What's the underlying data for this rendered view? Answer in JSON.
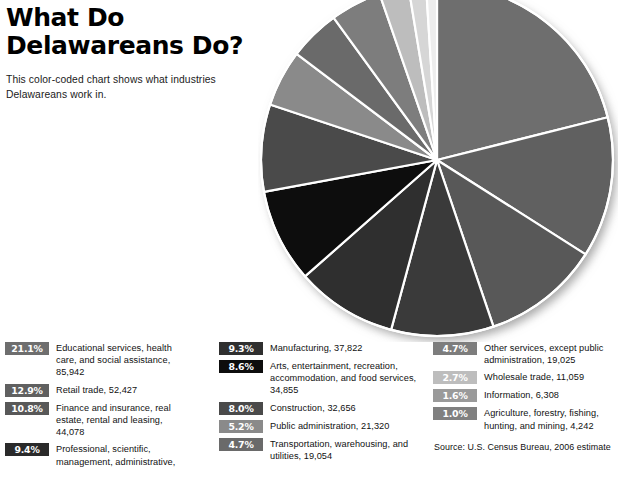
{
  "header": {
    "title": "What Do\nDelawareans Do?",
    "subtitle": "This color-coded chart shows what industries\nDelawareans work in."
  },
  "source": {
    "text": "Source: U.S. Census Bureau, 2006 estimate"
  },
  "chart_data": {
    "type": "pie",
    "title": "What Do Delawareans Do?",
    "subtitle": "This color-coded chart shows what industries Delawareans work in.",
    "start_angle_deg": 0,
    "direction": "clockwise",
    "units": "percent of employed workers",
    "categories": [
      "Educational services, health care, and social assistance",
      "Retail trade",
      "Finance and insurance, real estate, rental and leasing",
      "Professional, scientific, management, administrative",
      "Manufacturing",
      "Arts, entertainment, recreation, accommodation, and food services",
      "Construction",
      "Public administration",
      "Transportation, warehousing, and utilities",
      "Other services, except public administration",
      "Wholesale trade",
      "Information",
      "Agriculture, forestry, fishing, hunting, and mining"
    ],
    "values": [
      21.1,
      12.9,
      10.8,
      9.4,
      9.3,
      8.6,
      8.0,
      5.2,
      4.7,
      4.7,
      2.7,
      1.6,
      1.0
    ],
    "counts": [
      85942,
      52427,
      44078,
      44078,
      37822,
      34855,
      32656,
      21320,
      19054,
      19025,
      11059,
      6308,
      4242
    ],
    "colors": [
      "#6e6e6e",
      "#606060",
      "#585858",
      "#3a3a3a",
      "#2f2f2f",
      "#0d0d0d",
      "#4a4a4a",
      "#8a8a8a",
      "#6a6a6a",
      "#7d7d7d",
      "#bdbdbd",
      "#d6d6d6",
      "#ededed"
    ],
    "slice_border_color": "#ffffff",
    "legend_position": "below"
  },
  "legend": {
    "columns": [
      {
        "items": [
          {
            "percent": "21.1%",
            "label": "Educational services, health\ncare, and social assistance,\n85,942",
            "color": "#6e6e6e",
            "text_color": "#ffffff"
          },
          {
            "percent": "12.9%",
            "label": "Retail trade, 52,427",
            "color": "#606060",
            "text_color": "#ffffff"
          },
          {
            "percent": "10.8%",
            "label": "Finance and insurance, real\nestate, rental and leasing,\n44,078",
            "color": "#585858",
            "text_color": "#ffffff"
          },
          {
            "percent": "9.4%",
            "label": "Professional, scientific,\nmanagement, administrative,",
            "color": "#2a2a2a",
            "text_color": "#ffffff"
          }
        ]
      },
      {
        "items": [
          {
            "percent": "9.3%",
            "label": "Manufacturing, 37,822",
            "color": "#2f2f2f",
            "text_color": "#ffffff"
          },
          {
            "percent": "8.6%",
            "label": "Arts, entertainment, recreation,\naccommodation, and food services,\n34,855",
            "color": "#0d0d0d",
            "text_color": "#ffffff"
          },
          {
            "percent": "8.0%",
            "label": "Construction, 32,656",
            "color": "#4a4a4a",
            "text_color": "#ffffff"
          },
          {
            "percent": "5.2%",
            "label": "Public administration, 21,320",
            "color": "#8a8a8a",
            "text_color": "#ffffff"
          },
          {
            "percent": "4.7%",
            "label": "Transportation, warehousing, and\nutilities, 19,054",
            "color": "#6a6a6a",
            "text_color": "#ffffff"
          }
        ]
      },
      {
        "items": [
          {
            "percent": "4.7%",
            "label": "Other services, except public\nadministration, 19,025",
            "color": "#7d7d7d",
            "text_color": "#ffffff"
          },
          {
            "percent": "2.7%",
            "label": "Wholesale trade, 11,059",
            "color": "#bdbdbd",
            "text_color": "#ffffff"
          },
          {
            "percent": "1.6%",
            "label": "Information, 6,308",
            "color": "#9a9a9a",
            "text_color": "#ffffff"
          },
          {
            "percent": "1.0%",
            "label": "Agriculture, forestry, fishing,\nhunting, and mining, 4,242",
            "color": "#808080",
            "text_color": "#ffffff"
          }
        ]
      }
    ]
  }
}
